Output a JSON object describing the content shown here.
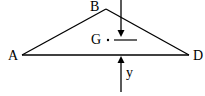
{
  "diagram": {
    "type": "triangle-force-diagram",
    "stroke_color": "#000000",
    "background_color": "#ffffff",
    "vertices": {
      "A": {
        "label": "A",
        "x": 22,
        "y": 55
      },
      "B": {
        "label": "B",
        "x": 106,
        "y": 9
      },
      "D": {
        "label": "D",
        "x": 189,
        "y": 55
      }
    },
    "centroid": {
      "label": "G",
      "x": 108,
      "y": 40
    },
    "forces": [
      {
        "name": "downward-load",
        "direction": "down",
        "x": 121,
        "from_y": 0,
        "to_y": 37,
        "label": ""
      },
      {
        "name": "upward-reaction",
        "direction": "up",
        "x": 121,
        "from_y": 92,
        "to_y": 56,
        "label": "y"
      }
    ],
    "reference_line": {
      "x1": 114,
      "x2": 137,
      "y": 40
    }
  }
}
